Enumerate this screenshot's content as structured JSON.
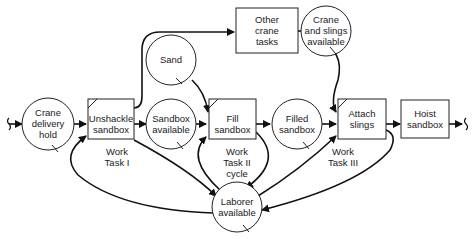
{
  "diagram": {
    "type": "cyclone-network",
    "nodes": {
      "crane_delivery_hold": {
        "label": "Crane\ndelivery\nhold",
        "shape": "circle"
      },
      "unshackle_sandbox": {
        "label": "Unshackle\nsandbox",
        "shape": "combi-box"
      },
      "sandbox_available": {
        "label": "Sandbox\navailable",
        "shape": "circle"
      },
      "sand": {
        "label": "Sand",
        "shape": "circle"
      },
      "fill_sandbox": {
        "label": "Fill\nsandbox",
        "shape": "combi-box"
      },
      "filled_sandbox": {
        "label": "Filled\nsandbox",
        "shape": "circle"
      },
      "other_crane_tasks": {
        "label": "Other\ncrane\ntasks",
        "shape": "box"
      },
      "crane_and_slings_available": {
        "label": "Crane\nand slings\navailable",
        "shape": "circle"
      },
      "attach_slings": {
        "label": "Attach\nslings",
        "shape": "combi-box"
      },
      "hoist_sandbox": {
        "label": "Hoist\nsandbox",
        "shape": "box"
      },
      "laborer_available": {
        "label": "Laborer\navailable",
        "shape": "circle"
      }
    },
    "annotations": {
      "work_task_1": "Work\nTask I",
      "work_task_2": "Work\nTask II\ncycle",
      "work_task_3": "Work\nTask III"
    },
    "edges": [
      [
        "input",
        "crane_delivery_hold"
      ],
      [
        "crane_delivery_hold",
        "unshackle_sandbox"
      ],
      [
        "unshackle_sandbox",
        "sandbox_available"
      ],
      [
        "unshackle_sandbox",
        "other_crane_tasks"
      ],
      [
        "unshackle_sandbox",
        "laborer_available"
      ],
      [
        "sandbox_available",
        "fill_sandbox"
      ],
      [
        "sand",
        "fill_sandbox"
      ],
      [
        "fill_sandbox",
        "filled_sandbox"
      ],
      [
        "fill_sandbox",
        "laborer_available"
      ],
      [
        "laborer_available",
        "fill_sandbox"
      ],
      [
        "laborer_available",
        "unshackle_sandbox"
      ],
      [
        "laborer_available",
        "attach_slings"
      ],
      [
        "other_crane_tasks",
        "crane_and_slings_available"
      ],
      [
        "crane_and_slings_available",
        "attach_slings"
      ],
      [
        "filled_sandbox",
        "attach_slings"
      ],
      [
        "attach_slings",
        "hoist_sandbox"
      ],
      [
        "attach_slings",
        "laborer_available"
      ],
      [
        "hoist_sandbox",
        "output"
      ]
    ]
  }
}
